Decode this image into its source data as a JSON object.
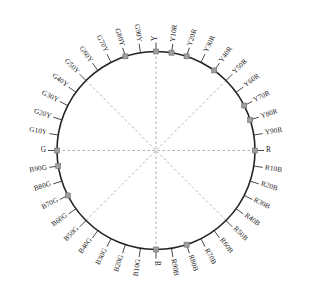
{
  "diagram": {
    "type": "color-circle",
    "center": {
      "x": 156,
      "y": 150.5
    },
    "radius": 99,
    "hue_count": 40,
    "colors": {
      "circle_stroke": "#222222",
      "tick_stroke": "#333333",
      "axis_dash": "#9a9a9a",
      "marker_fill": "#9e9e9e",
      "marker_stroke": "#6e6e6e",
      "label_text": "#1a1a1a",
      "background": "#ffffff"
    },
    "geometry": {
      "tick_inner_offset": 0,
      "tick_length": 9,
      "label_offset": 11,
      "marker_size": 5,
      "circle_stroke_width": 1.6,
      "axis_count": 4,
      "axis_angles_deg": [
        0,
        45,
        90,
        135
      ]
    },
    "labels": [
      {
        "text": "Y",
        "angle": 90,
        "marker": true
      },
      {
        "text": "Y10R",
        "angle": 81,
        "marker": true
      },
      {
        "text": "Y20R",
        "angle": 72,
        "marker": true
      },
      {
        "text": "Y30R",
        "angle": 63,
        "marker": false
      },
      {
        "text": "Y40R",
        "angle": 54,
        "marker": true
      },
      {
        "text": "Y50R",
        "angle": 45,
        "marker": false
      },
      {
        "text": "Y60R",
        "angle": 36,
        "marker": false
      },
      {
        "text": "Y70R",
        "angle": 27,
        "marker": true
      },
      {
        "text": "Y80R",
        "angle": 18,
        "marker": true
      },
      {
        "text": "Y90R",
        "angle": 9,
        "marker": false
      },
      {
        "text": "R",
        "angle": 0,
        "marker": true
      },
      {
        "text": "R10B",
        "angle": -9,
        "marker": false
      },
      {
        "text": "R20B",
        "angle": -18,
        "marker": false
      },
      {
        "text": "R30B",
        "angle": -27,
        "marker": false
      },
      {
        "text": "R40B",
        "angle": -36,
        "marker": false
      },
      {
        "text": "R50B",
        "angle": -45,
        "marker": false
      },
      {
        "text": "R60B",
        "angle": -54,
        "marker": false
      },
      {
        "text": "R70B",
        "angle": -63,
        "marker": false
      },
      {
        "text": "R80B",
        "angle": -72,
        "marker": true
      },
      {
        "text": "R90B",
        "angle": -81,
        "marker": false
      },
      {
        "text": "B",
        "angle": -90,
        "marker": true
      },
      {
        "text": "B10G",
        "angle": -99,
        "marker": false
      },
      {
        "text": "B20G",
        "angle": -108,
        "marker": false
      },
      {
        "text": "B30G",
        "angle": -117,
        "marker": false
      },
      {
        "text": "B40G",
        "angle": -126,
        "marker": false
      },
      {
        "text": "B50G",
        "angle": -135,
        "marker": false
      },
      {
        "text": "B60G",
        "angle": -144,
        "marker": false
      },
      {
        "text": "B70G",
        "angle": -153,
        "marker": true
      },
      {
        "text": "B80G",
        "angle": -162,
        "marker": false
      },
      {
        "text": "B90G",
        "angle": -171,
        "marker": true
      },
      {
        "text": "G",
        "angle": 180,
        "marker": true
      },
      {
        "text": "G10Y",
        "angle": 171,
        "marker": false
      },
      {
        "text": "G20Y",
        "angle": 162,
        "marker": false
      },
      {
        "text": "G30Y",
        "angle": 153,
        "marker": false
      },
      {
        "text": "G40Y",
        "angle": 144,
        "marker": false
      },
      {
        "text": "G50Y",
        "angle": 135,
        "marker": false
      },
      {
        "text": "G60Y",
        "angle": 126,
        "marker": false
      },
      {
        "text": "G70Y",
        "angle": 117,
        "marker": false
      },
      {
        "text": "G80Y",
        "angle": 108,
        "marker": true
      },
      {
        "text": "G90Y",
        "angle": 99,
        "marker": false
      }
    ]
  }
}
